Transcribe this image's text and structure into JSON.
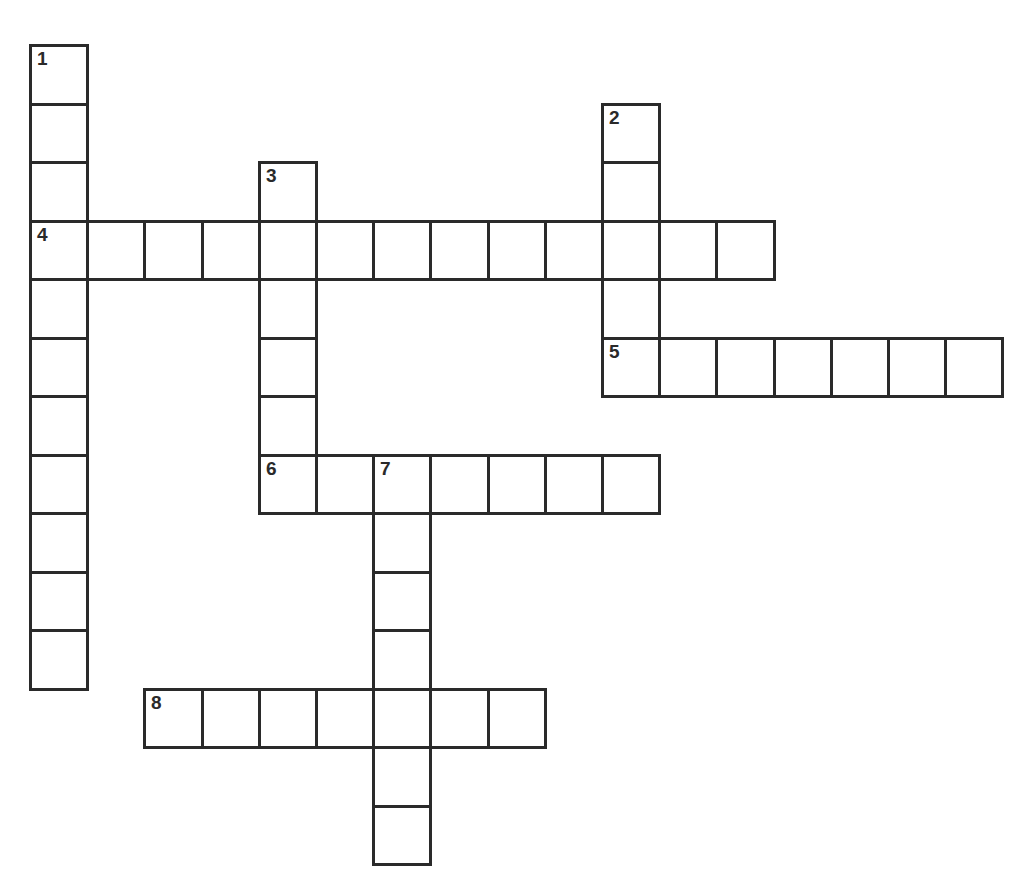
{
  "puzzle": {
    "type": "crossword",
    "grid": {
      "origin_x": 29,
      "origin_y": 44,
      "cell_w": 57.2,
      "cell_h": 58.5,
      "line_color": "#2a2a2a",
      "background": "#ffffff"
    },
    "entries": [
      {
        "number": "1",
        "direction": "down",
        "row": 0,
        "col": 0,
        "length": 11
      },
      {
        "number": "2",
        "direction": "down",
        "row": 1,
        "col": 10,
        "length": 4
      },
      {
        "number": "3",
        "direction": "down",
        "row": 2,
        "col": 4,
        "length": 6
      },
      {
        "number": "4",
        "direction": "across",
        "row": 3,
        "col": 0,
        "length": 13
      },
      {
        "number": "5",
        "direction": "across",
        "row": 5,
        "col": 10,
        "length": 7
      },
      {
        "number": "6",
        "direction": "across",
        "row": 7,
        "col": 4,
        "length": 7
      },
      {
        "number": "7",
        "direction": "down",
        "row": 7,
        "col": 6,
        "length": 7
      },
      {
        "number": "8",
        "direction": "across",
        "row": 11,
        "col": 2,
        "length": 7
      }
    ]
  }
}
